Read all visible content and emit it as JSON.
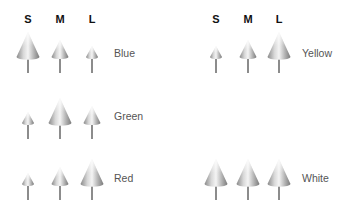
{
  "headers": {
    "left": [
      "S",
      "M",
      "L"
    ],
    "right": [
      "S",
      "M",
      "L"
    ]
  },
  "groups": [
    {
      "label": "Blue",
      "sizes": {
        "S": "large",
        "M": "medium",
        "L": "small"
      }
    },
    {
      "label": "Green",
      "sizes": {
        "S": "small",
        "M": "large",
        "L": "medium"
      }
    },
    {
      "label": "Red",
      "sizes": {
        "S": "small",
        "M": "medium",
        "L": "large"
      }
    },
    {
      "label": "Yellow",
      "sizes": {
        "S": "small",
        "M": "medium",
        "L": "large"
      }
    },
    {
      "label": "White",
      "sizes": {
        "S": "large",
        "M": "large",
        "L": "large"
      }
    }
  ],
  "icons": {
    "cone": "cone-on-stem-icon"
  }
}
